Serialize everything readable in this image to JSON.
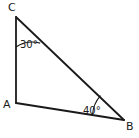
{
  "figure": {
    "kind": "geometry-diagram",
    "shape": "triangle",
    "background_color": "#ffffff",
    "stroke_color": "#1a1a1a",
    "label_color": "#1a1a1a",
    "width": 139,
    "height": 138
  },
  "vertices": [
    {
      "id": "C",
      "label": "C",
      "x": 16,
      "y": 17
    },
    {
      "id": "A",
      "label": "A",
      "x": 16,
      "y": 103
    },
    {
      "id": "B",
      "label": "B",
      "x": 124,
      "y": 120
    }
  ],
  "sides": [
    {
      "id": "CA",
      "from": "C",
      "to": "A"
    },
    {
      "id": "AB",
      "from": "A",
      "to": "B"
    },
    {
      "id": "CB",
      "from": "C",
      "to": "B"
    }
  ],
  "angles": [
    {
      "id": "angle-C",
      "at_vertex": "C",
      "value": 30,
      "unit": "degrees",
      "label": "30°",
      "arc_radius": 30
    },
    {
      "id": "angle-B",
      "at_vertex": "B",
      "value": 40,
      "unit": "degrees",
      "label": "40°",
      "arc_radius": 32
    }
  ],
  "geometry_paths": {
    "triangle_outline": "M 16 17 L 16 103 L 124 120 Z",
    "arc_at_C": "M 16 47 A 30 30 0 0 1 41 42",
    "arc_at_B": "M 92 118 A 32 32 0 0 1 101 96"
  }
}
